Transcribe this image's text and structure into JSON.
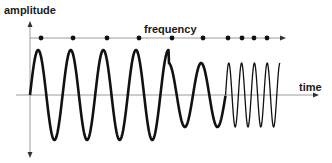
{
  "labels": {
    "y_axis": "amplitude",
    "x_axis": "time",
    "frequency_axis": "frequency"
  },
  "colors": {
    "axis": "#9a9a9a",
    "wave": "#111111",
    "text": "#1a1a1a",
    "dot": "#111111"
  },
  "frequency_markers": [
    41,
    73,
    107,
    139,
    172,
    203,
    228,
    242,
    254,
    267
  ],
  "wave_segments": [
    {
      "cycles": 4,
      "amplitude": "high",
      "frequency": "low"
    },
    {
      "cycles": 2,
      "amplitude": "medium",
      "frequency": "low"
    },
    {
      "cycles": 4,
      "amplitude": "medium",
      "frequency": "high"
    }
  ]
}
